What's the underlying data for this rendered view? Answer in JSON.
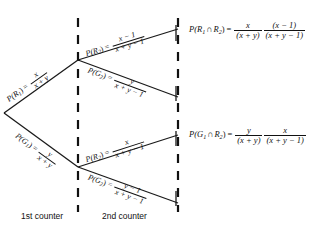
{
  "diagram": {
    "type": "probability-tree",
    "stages": [
      {
        "id": "stage-1",
        "caption": "1st counter"
      },
      {
        "id": "stage-2",
        "caption": "2nd counter"
      }
    ],
    "branches": {
      "level1": [
        {
          "id": "r1",
          "event": "R",
          "event_sub": "1",
          "label_prefix": "P(R",
          "numerator": "x",
          "denominator": "x + y"
        },
        {
          "id": "g1",
          "event": "G",
          "event_sub": "1",
          "label_prefix": "P(G",
          "numerator": "y",
          "denominator": "x + y"
        }
      ],
      "level2": [
        {
          "id": "r1-r2",
          "event": "R",
          "event_sub": "2",
          "numerator": "x − 1",
          "denominator": "x + y − 1"
        },
        {
          "id": "r1-g2",
          "event": "G",
          "event_sub": "2",
          "numerator": "y",
          "denominator": "x + y − 1"
        },
        {
          "id": "g1-r2",
          "event": "R",
          "event_sub": "2",
          "numerator": "x",
          "denominator": "x + y − 1"
        },
        {
          "id": "g1-g2",
          "event": "G",
          "event_sub": "2",
          "numerator": "y − 1",
          "denominator": "x + y − 1"
        }
      ]
    },
    "results": [
      {
        "id": "result-rr",
        "lhs_prefix": "P(R",
        "lhs_sub1": "1",
        "lhs_cap": "∩",
        "lhs_event2": "R",
        "lhs_sub2": "2",
        "lhs_suffix": ")",
        "frac1_num": "x",
        "frac1_den": "(x + y)",
        "frac2_num": "(x − 1)",
        "frac2_den": "(x + y − 1)"
      },
      {
        "id": "result-gr",
        "lhs_prefix": "P(G",
        "lhs_sub1": "1",
        "lhs_cap": "∩",
        "lhs_event2": "R",
        "lhs_sub2": "2",
        "lhs_suffix": ")",
        "frac1_num": "y",
        "frac1_den": "(x + y)",
        "frac2_num": "x",
        "frac2_den": "(x + y − 1)"
      }
    ],
    "symbols": {
      "equals": "=",
      "open_paren": "(",
      "close_paren": ")"
    },
    "colors": {
      "ink": "#111111",
      "background": "#ffffff",
      "rule": "#111111"
    }
  }
}
